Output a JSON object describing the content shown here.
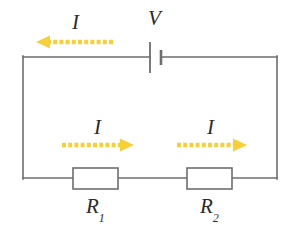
{
  "diagram": {
    "type": "circuit-schematic",
    "background_color": "#ffffff",
    "wire_color": "#6e6e6e",
    "component_outline_color": "#6e6e6e",
    "label_color": "#2b2b2b",
    "current_arrow_color": "#f7d038"
  },
  "labels": {
    "voltage_source": "V",
    "current_top": "I",
    "current_left_branch": "I",
    "current_right_branch": "I",
    "resistor_1_symbol": "R",
    "resistor_1_subscript": "1",
    "resistor_2_symbol": "R",
    "resistor_2_subscript": "2"
  },
  "components": [
    {
      "name": "battery",
      "label": "V",
      "kind": "voltage-source",
      "position": {
        "x": 155,
        "y": 57
      },
      "long_plate_x": 150,
      "short_plate_x": 161
    },
    {
      "name": "resistor-1",
      "label": "R1",
      "kind": "resistor",
      "box": {
        "x": 73,
        "y": 168,
        "width": 45,
        "height": 21
      }
    },
    {
      "name": "resistor-2",
      "label": "R2",
      "kind": "resistor",
      "box": {
        "x": 187,
        "y": 168,
        "width": 45,
        "height": 21
      }
    }
  ],
  "current_arrows": [
    {
      "name": "top-current-arrow",
      "label": "I",
      "direction": "left",
      "x_start": 113,
      "x_end": 37,
      "y": 42
    },
    {
      "name": "left-branch-current-arrow",
      "label": "I",
      "direction": "right",
      "x_start": 62,
      "x_end": 133,
      "y": 145
    },
    {
      "name": "right-branch-current-arrow",
      "label": "I",
      "direction": "right",
      "x_start": 177,
      "x_end": 246,
      "y": 145
    }
  ],
  "loop": {
    "left_x": 23,
    "right_x": 277,
    "top_y": 57,
    "bottom_y": 178
  }
}
